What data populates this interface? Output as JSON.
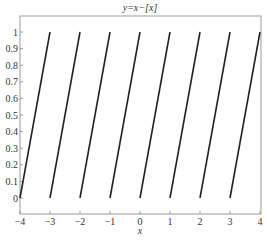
{
  "chart_data": {
    "type": "line",
    "title": "y=x−[x]",
    "xlabel": "x",
    "ylabel": "",
    "xlim": [
      -4,
      4
    ],
    "ylim": [
      0,
      1
    ],
    "grid": false,
    "legend": null,
    "x_ticks": [
      "-4",
      "-3",
      "-2",
      "-1",
      "0",
      "1",
      "2",
      "3",
      "4"
    ],
    "y_ticks": [
      "0",
      "0.1",
      "0.2",
      "0.3",
      "0.4",
      "0.5",
      "0.6",
      "0.7",
      "0.8",
      "0.9",
      "1"
    ],
    "series": [
      {
        "name": "y = x - floor(x)",
        "color": "#222222",
        "segments": [
          {
            "x": [
              -4,
              -3
            ],
            "y": [
              0,
              1
            ]
          },
          {
            "x": [
              -3,
              -2
            ],
            "y": [
              0,
              1
            ]
          },
          {
            "x": [
              -2,
              -1
            ],
            "y": [
              0,
              1
            ]
          },
          {
            "x": [
              -1,
              0
            ],
            "y": [
              0,
              1
            ]
          },
          {
            "x": [
              0,
              1
            ],
            "y": [
              0,
              1
            ]
          },
          {
            "x": [
              1,
              2
            ],
            "y": [
              0,
              1
            ]
          },
          {
            "x": [
              2,
              3
            ],
            "y": [
              0,
              1
            ]
          },
          {
            "x": [
              3,
              4
            ],
            "y": [
              0,
              1
            ]
          }
        ]
      }
    ]
  },
  "colors": {
    "frame": "#999999",
    "line": "#222222",
    "text": "#333333"
  }
}
